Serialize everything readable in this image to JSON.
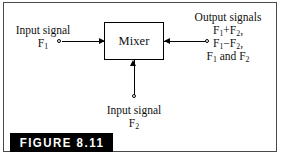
{
  "figure": {
    "caption": "FIGURE 8.11",
    "frame_color": "#4a4a4a",
    "background": "#ffffff",
    "ink_color": "#000000",
    "caption_bar_color": "#000000",
    "caption_text_color": "#ffffff"
  },
  "block": {
    "label": "Mixer"
  },
  "inputs": [
    {
      "id": "input-1",
      "title": "Input signal",
      "signal_base": "F",
      "signal_sub": "1",
      "position": "left",
      "arrow_direction": "right"
    },
    {
      "id": "input-2",
      "title": "Input signal",
      "signal_base": "F",
      "signal_sub": "2",
      "position": "bottom",
      "arrow_direction": "up"
    }
  ],
  "output": {
    "id": "output-1",
    "title": "Output signals",
    "position": "right",
    "arrow_direction": "left",
    "lines": [
      {
        "p1_base": "F",
        "p1_sub": "1",
        "operator": "+",
        "p2_base": "F",
        "p2_sub": "2",
        "trailing": ","
      },
      {
        "p1_base": "F",
        "p1_sub": "1",
        "operator": "−",
        "p2_base": "F",
        "p2_sub": "2",
        "trailing": ","
      },
      {
        "p1_base": "F",
        "p1_sub": "1",
        "operator": " and ",
        "p2_base": "F",
        "p2_sub": "2",
        "trailing": ""
      }
    ]
  }
}
